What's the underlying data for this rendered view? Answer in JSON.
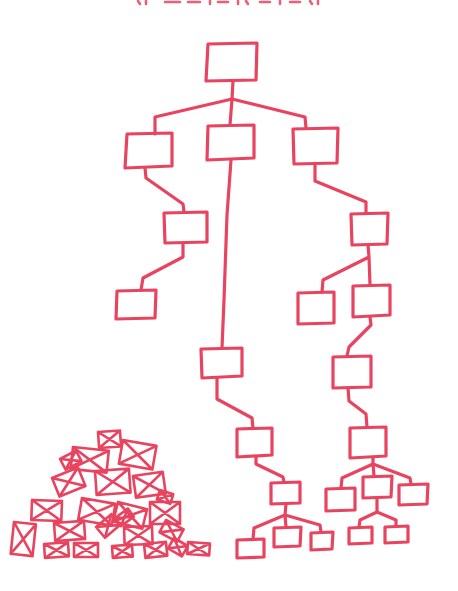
{
  "illustration": {
    "style": "hand-drawn marker sketch",
    "ink_color": "#e8445f",
    "background_color": "#ffffff",
    "title_clipped": true,
    "tree": {
      "description": "organized hierarchy of boxes",
      "root": {
        "x": 205,
        "y": 42,
        "w": 54,
        "h": 38
      },
      "nodes": [
        {
          "id": "L1a",
          "x": 124,
          "y": 134,
          "w": 48,
          "h": 35
        },
        {
          "id": "L1b",
          "x": 207,
          "y": 125,
          "w": 48,
          "h": 35
        },
        {
          "id": "L1c",
          "x": 292,
          "y": 128,
          "w": 47,
          "h": 36
        },
        {
          "id": "L2a",
          "x": 163,
          "y": 212,
          "w": 44,
          "h": 32
        },
        {
          "id": "L3a",
          "x": 116,
          "y": 290,
          "w": 40,
          "h": 30
        },
        {
          "id": "R2",
          "x": 350,
          "y": 213,
          "w": 38,
          "h": 32
        },
        {
          "id": "R3a",
          "x": 297,
          "y": 292,
          "w": 38,
          "h": 32
        },
        {
          "id": "R3b",
          "x": 352,
          "y": 285,
          "w": 38,
          "h": 32
        },
        {
          "id": "C4",
          "x": 200,
          "y": 348,
          "w": 42,
          "h": 30
        },
        {
          "id": "R4",
          "x": 332,
          "y": 356,
          "w": 40,
          "h": 32
        },
        {
          "id": "C5",
          "x": 236,
          "y": 428,
          "w": 37,
          "h": 29
        },
        {
          "id": "R5",
          "x": 349,
          "y": 427,
          "w": 37,
          "h": 31
        },
        {
          "id": "C6",
          "x": 270,
          "y": 482,
          "w": 30,
          "h": 22
        },
        {
          "id": "C7a",
          "x": 236,
          "y": 539,
          "w": 28,
          "h": 20
        },
        {
          "id": "C7b",
          "x": 273,
          "y": 527,
          "w": 28,
          "h": 20
        },
        {
          "id": "C7c",
          "x": 310,
          "y": 532,
          "w": 23,
          "h": 18
        },
        {
          "id": "R6a",
          "x": 325,
          "y": 488,
          "w": 30,
          "h": 23
        },
        {
          "id": "R6b",
          "x": 362,
          "y": 476,
          "w": 30,
          "h": 22
        },
        {
          "id": "R6c",
          "x": 398,
          "y": 484,
          "w": 30,
          "h": 20
        },
        {
          "id": "R7a",
          "x": 348,
          "y": 527,
          "w": 24,
          "h": 17
        },
        {
          "id": "R7b",
          "x": 384,
          "y": 526,
          "w": 24,
          "h": 17
        }
      ]
    },
    "pile": {
      "description": "disorganized pile of envelopes",
      "envelope_count": 24
    }
  }
}
